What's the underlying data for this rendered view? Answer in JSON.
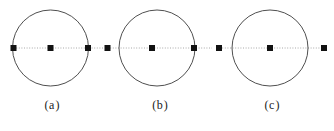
{
  "figure": {
    "width": 334,
    "height": 131,
    "background_color": "#ffffff",
    "circle_stroke_color": "#3b3b3b",
    "circle_fill": "none",
    "axis_line_color": "#a8a8a8",
    "axis_line_style": "dotted",
    "marker_color": "#121212",
    "marker_shape": "square",
    "marker_size_px": 6,
    "caption_color": "#1b1b1b",
    "panels": [
      {
        "id": "a",
        "caption_open": "(",
        "caption_text": "a",
        "caption_close": ")",
        "caption_full": "(a)",
        "circle": {
          "cx": 50.5,
          "cy": 48,
          "r": 38
        },
        "axis": {
          "y": 48,
          "x_start": 11,
          "x_end": 103
        },
        "markers": [
          {
            "name": "left-endpoint",
            "x": 13.5,
            "y": 48,
            "position": "on-circle-left"
          },
          {
            "name": "center-point",
            "x": 50.5,
            "y": 48,
            "position": "circle-center"
          },
          {
            "name": "right-endpoint",
            "x": 88,
            "y": 48,
            "position": "on-circle-right"
          }
        ]
      },
      {
        "id": "b",
        "caption_open": "(",
        "caption_text": "b",
        "caption_close": ")",
        "caption_full": "(b)",
        "circle": {
          "cx": 157,
          "cy": 48,
          "r": 38
        },
        "axis": {
          "y": 48,
          "x_start": 105,
          "x_end": 212
        },
        "markers": [
          {
            "name": "left-endpoint",
            "x": 107.5,
            "y": 48,
            "position": "outside-circle-left"
          },
          {
            "name": "center-point",
            "x": 152,
            "y": 48,
            "position": "inside-circle"
          },
          {
            "name": "right-endpoint",
            "x": 194,
            "y": 48,
            "position": "on-circle-right"
          }
        ]
      },
      {
        "id": "c",
        "caption_open": "(",
        "caption_text": "c",
        "caption_close": ")",
        "caption_full": "(c)",
        "circle": {
          "cx": 270,
          "cy": 48,
          "r": 38
        },
        "axis": {
          "y": 48,
          "x_start": 217,
          "x_end": 327
        },
        "markers": [
          {
            "name": "left-endpoint",
            "x": 219,
            "y": 48,
            "position": "outside-circle-left"
          },
          {
            "name": "center-point",
            "x": 270,
            "y": 48,
            "position": "circle-center"
          },
          {
            "name": "right-endpoint",
            "x": 324,
            "y": 48,
            "position": "outside-circle-right"
          }
        ]
      }
    ]
  }
}
